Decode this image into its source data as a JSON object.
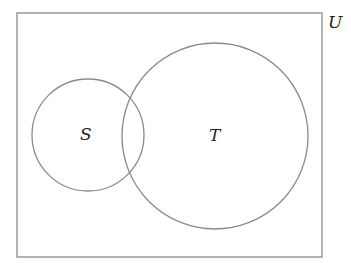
{
  "diagram": {
    "type": "venn",
    "universe": {
      "label": "U",
      "x": 17,
      "y": 13,
      "width": 305,
      "height": 244
    },
    "sets": [
      {
        "label": "S",
        "cx": 88,
        "cy": 135,
        "r": 56
      },
      {
        "label": "T",
        "cx": 215,
        "cy": 136,
        "r": 93
      }
    ],
    "stroke_color": "#8a8a8a"
  }
}
